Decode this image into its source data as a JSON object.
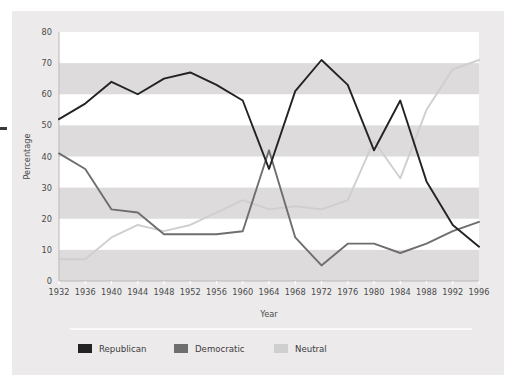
{
  "chart_data": {
    "type": "line",
    "title": "",
    "xlabel": "Year",
    "ylabel": "Percentage",
    "categories": [
      "1932",
      "1936",
      "1940",
      "1944",
      "1948",
      "1952",
      "1956",
      "1960",
      "1964",
      "1968",
      "1972",
      "1976",
      "1980",
      "1984",
      "1988",
      "1992",
      "1996"
    ],
    "x": [
      1932,
      1936,
      1940,
      1944,
      1948,
      1952,
      1956,
      1960,
      1964,
      1968,
      1972,
      1976,
      1980,
      1984,
      1988,
      1992,
      1996
    ],
    "xlim": [
      1932,
      1996
    ],
    "ylim": [
      0,
      80
    ],
    "yticks": [
      0,
      10,
      20,
      30,
      40,
      50,
      60,
      70,
      80
    ],
    "ytick_labels": [
      "0",
      "10",
      "20",
      "30",
      "40",
      "50",
      "60",
      "70",
      "80"
    ],
    "grid": "horizontal-bands",
    "legend_position": "bottom",
    "series": [
      {
        "name": "Republican",
        "color": "#232323",
        "values": [
          52,
          57,
          64,
          60,
          65,
          67,
          63,
          58,
          36,
          61,
          71,
          63,
          42,
          58,
          32,
          18,
          11
        ]
      },
      {
        "name": "Democratic",
        "color": "#6e6e6e",
        "values": [
          41,
          36,
          23,
          22,
          15,
          15,
          15,
          16,
          42,
          14,
          5,
          12,
          12,
          9,
          12,
          16,
          19
        ]
      },
      {
        "name": "Neutral",
        "color": "#cfcfcf",
        "values": [
          7,
          7,
          14,
          18,
          16,
          18,
          22,
          26,
          23,
          24,
          23,
          26,
          45,
          33,
          55,
          68,
          71
        ]
      }
    ]
  },
  "axes": {
    "x_axis_title": "Year",
    "y_axis_title": "Percentage"
  },
  "legend": {
    "items": [
      {
        "label": "Republican",
        "color": "#232323"
      },
      {
        "label": "Democratic",
        "color": "#6e6e6e"
      },
      {
        "label": "Neutral",
        "color": "#cfcfcf"
      }
    ]
  },
  "colors": {
    "card_background": "#eceaea",
    "plot_background": "#ffffff",
    "band_color": "#dddbdb",
    "axis_color": "#b9b7b7",
    "text_color": "#4a4a4a"
  }
}
